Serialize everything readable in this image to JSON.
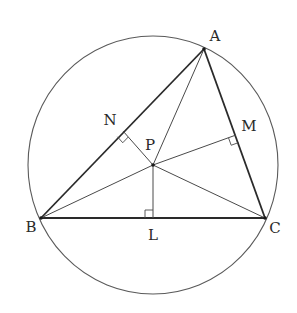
{
  "figure": {
    "type": "geometry",
    "circle": {
      "cx": 153,
      "cy": 165,
      "rx": 125,
      "ry": 129
    },
    "points": {
      "A": {
        "x": 204,
        "y": 49,
        "label": "A",
        "label_x": 215,
        "label_y": 37
      },
      "B": {
        "x": 41,
        "y": 218,
        "label": "B",
        "label_x": 31,
        "label_y": 228
      },
      "C": {
        "x": 265,
        "y": 218,
        "label": "C",
        "label_x": 275,
        "label_y": 229
      },
      "P": {
        "x": 153,
        "y": 165,
        "label": "P",
        "label_x": 150,
        "label_y": 146
      },
      "L": {
        "x": 153,
        "y": 218,
        "label": "L",
        "label_x": 153,
        "label_y": 236
      },
      "M": {
        "x": 236,
        "y": 135,
        "label": "M",
        "label_x": 249,
        "label_y": 127
      },
      "N": {
        "x": 123,
        "y": 131,
        "label": "N",
        "label_x": 110,
        "label_y": 121
      }
    },
    "segments": [
      {
        "from": "A",
        "to": "B",
        "style": "side"
      },
      {
        "from": "B",
        "to": "C",
        "style": "side"
      },
      {
        "from": "C",
        "to": "A",
        "style": "side"
      },
      {
        "from": "P",
        "to": "A",
        "style": "cevian"
      },
      {
        "from": "P",
        "to": "B",
        "style": "cevian"
      },
      {
        "from": "P",
        "to": "C",
        "style": "cevian"
      },
      {
        "from": "P",
        "to": "L",
        "style": "perp"
      },
      {
        "from": "P",
        "to": "M",
        "style": "perp"
      },
      {
        "from": "P",
        "to": "N",
        "style": "perp"
      }
    ],
    "right_angles": [
      "L",
      "M",
      "N"
    ]
  }
}
